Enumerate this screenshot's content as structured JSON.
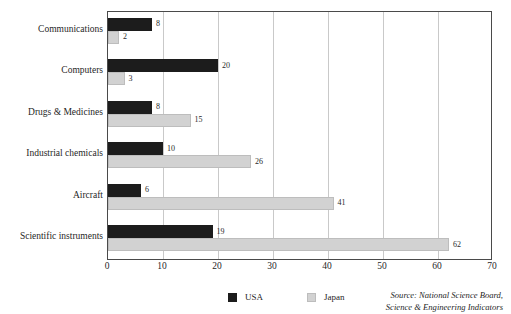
{
  "chart_data": {
    "type": "bar",
    "orientation": "horizontal",
    "title": "",
    "subtitle": "",
    "xlabel": "",
    "ylabel": "",
    "xlim": [
      0,
      70
    ],
    "xticks": [
      0,
      10,
      20,
      30,
      40,
      50,
      60,
      70
    ],
    "grid": "vertical",
    "legend_position": "bottom-center",
    "categories": [
      "Communications",
      "Computers",
      "Drugs & Medicines",
      "Industrial chemicals",
      "Aircraft",
      "Scientific instruments"
    ],
    "series": [
      {
        "name": "USA",
        "color": "#1c1c1c",
        "values": [
          8,
          20,
          8,
          10,
          6,
          19
        ]
      },
      {
        "name": "Japan",
        "color": "#d2d2d2",
        "values": [
          2,
          3,
          15,
          26,
          41,
          62
        ]
      }
    ],
    "data_labels": {
      "USA": [
        "8",
        "20",
        "8",
        "10",
        "6",
        "19"
      ],
      "Japan": [
        "2",
        "3",
        "15",
        "26",
        "41",
        "62"
      ]
    }
  },
  "axis": {
    "x_tick_labels": [
      "0",
      "10",
      "20",
      "30",
      "40",
      "50",
      "60",
      "70"
    ],
    "y_tick_labels": [
      "Communications",
      "Computers",
      "Drugs & Medicines",
      "Industrial chemicals",
      "Aircraft",
      "Scientific instruments"
    ]
  },
  "legend": {
    "items": [
      {
        "label": "USA",
        "color": "#1c1c1c"
      },
      {
        "label": "Japan",
        "color": "#d2d2d2"
      }
    ]
  },
  "source_note": {
    "line1": "Source: National Science Board,",
    "line2": "Science & Engineering Indicators"
  },
  "clipped_title": ""
}
